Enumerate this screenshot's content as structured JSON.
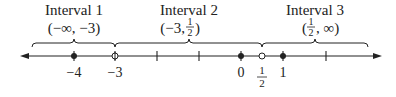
{
  "diagram": {
    "type": "number-line-intervals",
    "colors": {
      "ink": "#222222",
      "background": "#ffffff"
    },
    "axis": {
      "direction": "both-arrows",
      "y": 56,
      "x_start": 22,
      "x_end": 380,
      "zero_px": 241,
      "unit_px": 41.6
    },
    "ticks": [
      -2,
      -1,
      2
    ],
    "points": [
      {
        "value": -4,
        "label": "−4",
        "style": "filled"
      },
      {
        "value": -3,
        "label": "−3",
        "style": "open-crossed"
      },
      {
        "value": 0,
        "label": "0",
        "style": "filled"
      },
      {
        "value": 0.5,
        "label_num": "1",
        "label_den": "2",
        "style": "open"
      },
      {
        "value": 1,
        "label": "1",
        "style": "filled"
      }
    ],
    "intervals": [
      {
        "title": "Interval 1",
        "notation": "(−∞, −3)",
        "from_px": 32,
        "to_px": 115,
        "tip_px": 74
      },
      {
        "title": "Interval 2",
        "notation_pre": "(−3, ",
        "notation_num": "1",
        "notation_den": "2",
        "notation_post": ")",
        "from_px": 115,
        "to_px": 262,
        "tip_px": 189
      },
      {
        "title": "Interval 3",
        "notation_pre": "(",
        "notation_num": "1",
        "notation_den": "2",
        "notation_post": ", ∞)",
        "from_px": 262,
        "to_px": 368,
        "tip_px": 315
      }
    ]
  }
}
